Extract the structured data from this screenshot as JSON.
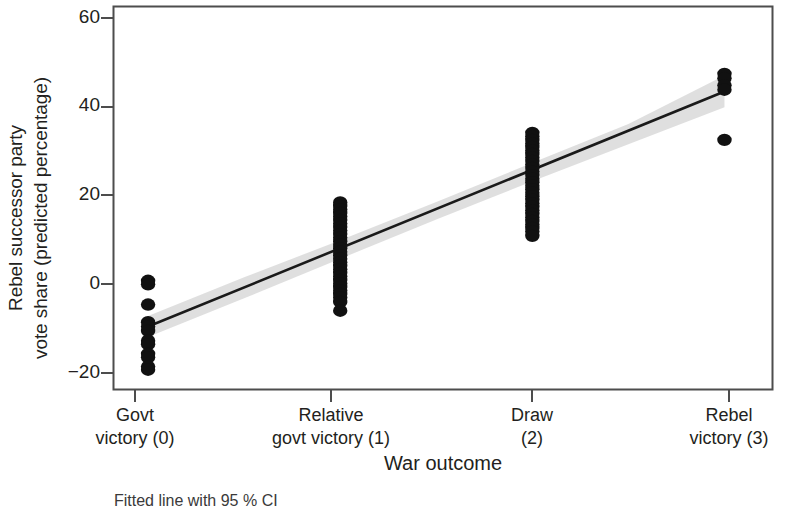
{
  "chart_data": {
    "type": "scatter",
    "title": "",
    "subtitle": "",
    "xlabel": "War outcome",
    "ylabel_line1": "Rebel successor party",
    "ylabel_line2": "vote share (predicted percentage)",
    "caption": "Fitted line with 95 % CI",
    "grid": false,
    "legend": "none",
    "xlim": [
      -0.18,
      3.25
    ],
    "ylim": [
      -24.5,
      62.5
    ],
    "yticks": [
      60,
      40,
      20,
      0,
      -20
    ],
    "ytick_labels": [
      "60",
      "40",
      "20",
      "0",
      "−20"
    ],
    "xticks": [
      0,
      1,
      2,
      3
    ],
    "xtick_labels": [
      {
        "line1": "Govt",
        "line2": "victory (0)"
      },
      {
        "line1": "Relative",
        "line2": "govt victory (1)"
      },
      {
        "line1": "Draw",
        "line2": "(2)"
      },
      {
        "line1": "Rebel",
        "line2": "victory (3)"
      }
    ],
    "series": [
      {
        "name": "Predicted vote share observations",
        "marker": "filled-circle",
        "color": "#111111",
        "points": [
          {
            "x": 0,
            "y": 0.2
          },
          {
            "x": 0,
            "y": -0.6
          },
          {
            "x": 0,
            "y": -5.2
          },
          {
            "x": 0,
            "y": -9.2
          },
          {
            "x": 0,
            "y": -10.2
          },
          {
            "x": 0,
            "y": -11.2
          },
          {
            "x": 0,
            "y": -13.4
          },
          {
            "x": 0,
            "y": -14.2
          },
          {
            "x": 0,
            "y": -16.4
          },
          {
            "x": 0,
            "y": -17.2
          },
          {
            "x": 0,
            "y": -19.3
          },
          {
            "x": 0,
            "y": -20.0
          },
          {
            "x": 1,
            "y": 18.0
          },
          {
            "x": 1,
            "y": 17.2
          },
          {
            "x": 1,
            "y": 16.4
          },
          {
            "x": 1,
            "y": 15.6
          },
          {
            "x": 1,
            "y": 14.8
          },
          {
            "x": 1,
            "y": 14.0
          },
          {
            "x": 1,
            "y": 13.2
          },
          {
            "x": 1,
            "y": 12.4
          },
          {
            "x": 1,
            "y": 11.6
          },
          {
            "x": 1,
            "y": 10.8
          },
          {
            "x": 1,
            "y": 10.0
          },
          {
            "x": 1,
            "y": 9.2
          },
          {
            "x": 1,
            "y": 8.4
          },
          {
            "x": 1,
            "y": 7.6
          },
          {
            "x": 1,
            "y": 6.8
          },
          {
            "x": 1,
            "y": 6.0
          },
          {
            "x": 1,
            "y": 5.2
          },
          {
            "x": 1,
            "y": 4.4
          },
          {
            "x": 1,
            "y": 3.6
          },
          {
            "x": 1,
            "y": 2.8
          },
          {
            "x": 1,
            "y": 2.0
          },
          {
            "x": 1,
            "y": 1.2
          },
          {
            "x": 1,
            "y": 0.4
          },
          {
            "x": 1,
            "y": -0.4
          },
          {
            "x": 1,
            "y": -1.2
          },
          {
            "x": 1,
            "y": -2.0
          },
          {
            "x": 1,
            "y": -2.8
          },
          {
            "x": 1,
            "y": -3.6
          },
          {
            "x": 1,
            "y": -4.6
          },
          {
            "x": 1,
            "y": -6.6
          },
          {
            "x": 2,
            "y": 33.8
          },
          {
            "x": 2,
            "y": 33.0
          },
          {
            "x": 2,
            "y": 32.2
          },
          {
            "x": 2,
            "y": 31.4
          },
          {
            "x": 2,
            "y": 30.6
          },
          {
            "x": 2,
            "y": 29.8
          },
          {
            "x": 2,
            "y": 29.0
          },
          {
            "x": 2,
            "y": 28.2
          },
          {
            "x": 2,
            "y": 27.4
          },
          {
            "x": 2,
            "y": 26.6
          },
          {
            "x": 2,
            "y": 25.8
          },
          {
            "x": 2,
            "y": 25.0
          },
          {
            "x": 2,
            "y": 24.2
          },
          {
            "x": 2,
            "y": 23.4
          },
          {
            "x": 2,
            "y": 22.6
          },
          {
            "x": 2,
            "y": 21.8
          },
          {
            "x": 2,
            "y": 21.0
          },
          {
            "x": 2,
            "y": 20.2
          },
          {
            "x": 2,
            "y": 19.4
          },
          {
            "x": 2,
            "y": 18.6
          },
          {
            "x": 2,
            "y": 17.8
          },
          {
            "x": 2,
            "y": 17.0
          },
          {
            "x": 2,
            "y": 16.2
          },
          {
            "x": 2,
            "y": 15.4
          },
          {
            "x": 2,
            "y": 14.6
          },
          {
            "x": 2,
            "y": 13.8
          },
          {
            "x": 2,
            "y": 13.0
          },
          {
            "x": 2,
            "y": 12.2
          },
          {
            "x": 2,
            "y": 11.4
          },
          {
            "x": 2,
            "y": 10.4
          },
          {
            "x": 3,
            "y": 47.2
          },
          {
            "x": 3,
            "y": 46.2
          },
          {
            "x": 3,
            "y": 44.6
          },
          {
            "x": 3,
            "y": 43.6
          },
          {
            "x": 3,
            "y": 32.2
          }
        ]
      }
    ],
    "fit_line": {
      "name": "Fitted line",
      "color": "#1a1a1a",
      "x": [
        0,
        3
      ],
      "y": [
        -10.2,
        43.2
      ],
      "intercept": -10.2,
      "slope": 17.8
    },
    "confidence_band": {
      "name": "95 % CI",
      "level": 95,
      "color": "#d9d9d9",
      "x": [
        0,
        0.5,
        1,
        1.5,
        2,
        2.5,
        3
      ],
      "lower": [
        -12.6,
        -3.8,
        5.2,
        14.1,
        22.8,
        31.2,
        39.6
      ],
      "upper": [
        -7.8,
        1.0,
        9.4,
        18.1,
        27.0,
        35.8,
        46.8
      ]
    }
  },
  "axes": {
    "frame_color": "#4d4d4d",
    "tick_color": "#4d4d4d"
  }
}
